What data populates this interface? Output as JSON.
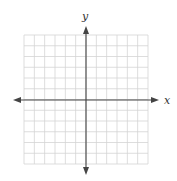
{
  "diagram": {
    "type": "coordinate-plane",
    "grid": {
      "columns": 12,
      "rows": 12,
      "left": 24,
      "top": 35,
      "right": 148,
      "bottom": 164,
      "color": "#d4d4d4"
    },
    "axes": {
      "color": "#444444",
      "origin": {
        "x": 86,
        "y": 100
      },
      "x_axis": {
        "label": "x",
        "from": 14,
        "to": 158
      },
      "y_axis": {
        "label": "y",
        "from": 26,
        "to": 174
      }
    }
  }
}
